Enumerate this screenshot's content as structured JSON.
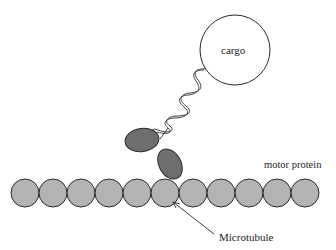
{
  "diagram": {
    "labels": {
      "cargo": "cargo",
      "motor_protein": "motor protein",
      "microtubule": "Microtubule"
    },
    "colors": {
      "tubulin_fill": "#b3b3b3",
      "motor_head_fill": "#6e6e6e",
      "stroke": "#2a2a2a",
      "background": "#ffffff"
    },
    "microtubule_subunit_count": 11
  }
}
